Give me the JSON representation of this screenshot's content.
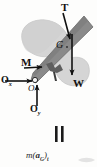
{
  "figure": {
    "type": "free-body-and-kinetic-diagram",
    "width": 97,
    "height": 167,
    "background_color": "#fdfdfc"
  },
  "colors": {
    "rod_fill": "#8a8a8a",
    "rod_stroke": "#6f6f6f",
    "blade_fill": "#d5d5d5",
    "blade_stroke": "#bdbdbd",
    "arrow": "#111111",
    "label": "#111111",
    "equals": "#1a1a1a"
  },
  "free_body_diagram": {
    "name": "free-body-diagram",
    "bodies": [
      {
        "name": "blade-shape",
        "fill": "#d5d5d5",
        "description": "light gray airfoil/blade silhouette"
      },
      {
        "name": "rod-shape",
        "fill": "#8a8a8a",
        "description": "dark gray inclined rod"
      }
    ],
    "forces": [
      {
        "id": "T",
        "label": "T",
        "style": "bold",
        "description": "applied force, arrow pointing down-right onto rod near top",
        "arrow_from": {
          "x": 64,
          "y": 14
        },
        "arrow_to": {
          "x": 71,
          "y": 40
        }
      },
      {
        "id": "W",
        "label": "W",
        "style": "bold",
        "description": "weight, vertical arrow pointing down from G",
        "arrow_from": {
          "x": 72,
          "y": 36
        },
        "arrow_to": {
          "x": 72,
          "y": 76
        }
      },
      {
        "id": "M",
        "label": "M",
        "style": "bold",
        "description": "couple moment, short arrow pointing right into rod",
        "arrow_from": {
          "x": 25,
          "y": 68
        },
        "arrow_to": {
          "x": 43,
          "y": 67
        }
      },
      {
        "id": "Ox",
        "label": "O",
        "subscript": "x",
        "style": "bold",
        "description": "horizontal pin reaction at O, arrow pointing right",
        "arrow_from": {
          "x": 5,
          "y": 81
        },
        "arrow_to": {
          "x": 33,
          "y": 81
        }
      },
      {
        "id": "Oy",
        "label": "O",
        "subscript": "y",
        "style": "bold",
        "description": "vertical pin reaction at O, arrow pointing up",
        "arrow_from": {
          "x": 37,
          "y": 105
        },
        "arrow_to": {
          "x": 37,
          "y": 84
        }
      }
    ],
    "points": [
      {
        "id": "G",
        "label": "G",
        "style": "italic",
        "description": "center of gravity marker on rod"
      },
      {
        "id": "O",
        "label": "O",
        "style": "italic",
        "description": "pin support at lower end of rod"
      }
    ]
  },
  "equals_sign": {
    "name": "equals-sign",
    "label": "=",
    "orientation": "vertical-bars",
    "description": "equality between free-body diagram and kinetic diagram"
  },
  "kinetic_diagram": {
    "name": "kinetic-diagram",
    "expression": "m(a_G)_t",
    "parts": {
      "mass": "m",
      "open_paren": "(",
      "accel_vector": "a",
      "accel_subscript": "G",
      "close_paren": ")",
      "component_subscript": "t"
    },
    "description": "mass times tangential acceleration of the mass center"
  }
}
